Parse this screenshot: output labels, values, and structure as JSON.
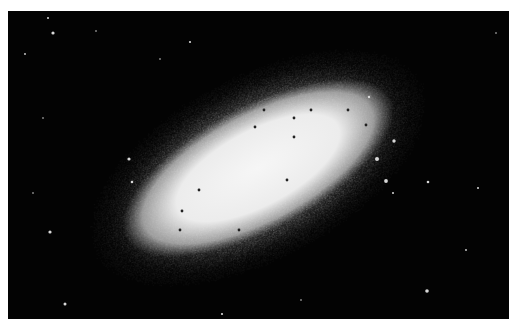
{
  "image": {
    "subject": "elliptical galaxy",
    "style": "grayscale astronomical photograph",
    "background_color": "#030303",
    "margin_color": "#ffffff",
    "frame": {
      "x": 8,
      "y": 11,
      "width": 501,
      "height": 308
    },
    "galaxy": {
      "center": [
        258,
        168
      ],
      "rotation_deg": -28,
      "core_radii": [
        150,
        62
      ],
      "halo_radii": [
        200,
        100
      ],
      "core_color": "#f2f2f2"
    },
    "dark_specks": [
      [
        199,
        190
      ],
      [
        182,
        211
      ],
      [
        255,
        127
      ],
      [
        264,
        110
      ],
      [
        311,
        110
      ],
      [
        287,
        180
      ],
      [
        366,
        125
      ],
      [
        294,
        137
      ],
      [
        239,
        230
      ],
      [
        180,
        230
      ],
      [
        294,
        118
      ],
      [
        348,
        110
      ]
    ],
    "background_stars": [
      [
        53,
        33,
        1.6
      ],
      [
        48,
        18,
        1.0
      ],
      [
        25,
        54,
        0.9
      ],
      [
        190,
        42,
        1.1
      ],
      [
        96,
        31,
        0.8
      ],
      [
        129,
        159,
        1.6
      ],
      [
        132,
        182,
        1.3
      ],
      [
        50,
        232,
        1.6
      ],
      [
        65,
        304,
        1.5
      ],
      [
        222,
        314,
        1.1
      ],
      [
        394,
        141,
        1.7
      ],
      [
        377,
        159,
        2.0
      ],
      [
        386,
        181,
        1.9
      ],
      [
        428,
        182,
        1.3
      ],
      [
        478,
        188,
        1.0
      ],
      [
        427,
        291,
        1.8
      ],
      [
        496,
        33,
        0.8
      ],
      [
        43,
        118,
        0.8
      ],
      [
        466,
        250,
        0.9
      ],
      [
        393,
        193,
        1.0
      ],
      [
        369,
        97,
        1.2
      ],
      [
        160,
        59,
        0.8
      ],
      [
        33,
        193,
        0.8
      ],
      [
        301,
        300,
        0.8
      ]
    ]
  }
}
